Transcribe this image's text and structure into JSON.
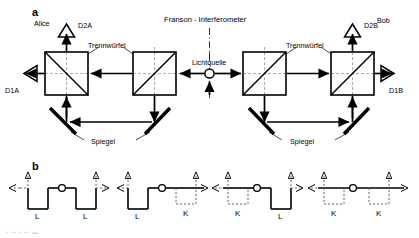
{
  "figure": {
    "title": "Franson - Interferometer",
    "panels": [
      {
        "letter": "a",
        "name": "setup"
      },
      {
        "letter": "b",
        "name": "path-combinations"
      }
    ]
  },
  "panel_a": {
    "title": "Franson - Interferometer",
    "observers": {
      "left": "Alice",
      "right": "Bob"
    },
    "source_label": "Lichtquelle",
    "beamsplitter_label": "Trennwürfel",
    "mirror_label": "Spiegel",
    "detectors": [
      {
        "id": "D2A",
        "label": "D2A",
        "side": "left",
        "direction": "up"
      },
      {
        "id": "D1A",
        "label": "D1A",
        "side": "left",
        "direction": "left"
      },
      {
        "id": "D2B",
        "label": "D2B",
        "side": "right",
        "direction": "up"
      },
      {
        "id": "D1B",
        "label": "D1B",
        "side": "right",
        "direction": "right"
      }
    ],
    "beamsplitter_count": 4,
    "mirror_count": 4,
    "axis": "dash-dot vertical symmetry axis through light source"
  },
  "panel_b": {
    "letter": "b",
    "path_label_long": "L",
    "path_label_short": "K",
    "diagrams": [
      {
        "index": 1,
        "left": "L",
        "right": "L",
        "left_style": "solid",
        "right_style": "solid"
      },
      {
        "index": 2,
        "left": "L",
        "right": "K",
        "left_style": "solid",
        "right_style": "dashed"
      },
      {
        "index": 3,
        "left": "K",
        "right": "L",
        "left_style": "dashed",
        "right_style": "solid"
      },
      {
        "index": 4,
        "left": "K",
        "right": "K",
        "left_style": "dashed",
        "right_style": "dashed"
      }
    ]
  },
  "colors": {
    "ink": "#000000",
    "background": "#ffffff",
    "dashed": "#6b6b6b"
  }
}
